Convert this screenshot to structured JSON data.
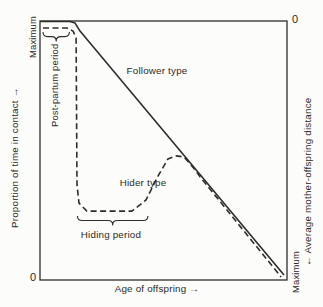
{
  "figure": {
    "background_color": "#fcfcfa",
    "line_color": "#2e2d29",
    "text_color": "#2b2a26"
  },
  "chart_data": {
    "type": "line",
    "title": "",
    "xlabel": "Age of offspring →",
    "grid": false,
    "left_axis": {
      "label": "Proportion of time in contact →",
      "max_label": "Maximum",
      "origin_label": "0",
      "range_note": "qualitative scale, 0 at bottom to Maximum at top"
    },
    "right_axis": {
      "label": "← Average mother-offspring distance",
      "zero_label": "0",
      "max_label": "Maximum",
      "range_note": "qualitative scale, 0 at top to Maximum at bottom"
    },
    "series": [
      {
        "name": "Follower type",
        "style": "solid",
        "points": [
          [
            0.0,
            0.998
          ],
          [
            0.121,
            0.998
          ],
          [
            0.142,
            0.992
          ],
          [
            0.162,
            0.961
          ],
          [
            0.988,
            0.019
          ]
        ]
      },
      {
        "name": "Hider type",
        "style": "dashed",
        "points": [
          [
            0.012,
            0.973
          ],
          [
            0.109,
            0.973
          ],
          [
            0.134,
            0.961
          ],
          [
            0.146,
            0.934
          ],
          [
            0.15,
            0.367
          ],
          [
            0.158,
            0.297
          ],
          [
            0.19,
            0.266
          ],
          [
            0.372,
            0.266
          ],
          [
            0.429,
            0.309
          ],
          [
            0.478,
            0.402
          ],
          [
            0.518,
            0.467
          ],
          [
            0.551,
            0.479
          ],
          [
            0.583,
            0.475
          ],
          [
            0.619,
            0.436
          ],
          [
            0.648,
            0.398
          ],
          [
            0.976,
            0.012
          ]
        ]
      }
    ],
    "annotations": [
      {
        "type": "brace",
        "label": "Post-partum period",
        "x1": 0.012,
        "x2": 0.119,
        "y": 0.957
      },
      {
        "type": "brace",
        "label": "Hiding period",
        "x1": 0.152,
        "x2": 0.437,
        "y": 0.247
      }
    ]
  }
}
